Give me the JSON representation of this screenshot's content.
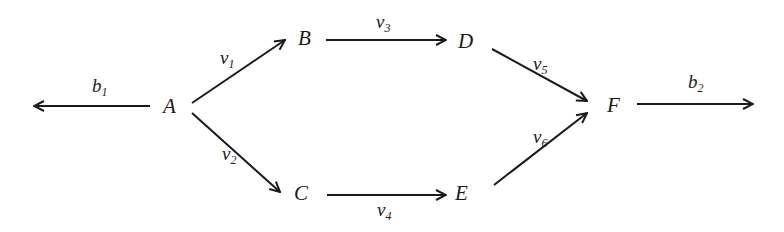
{
  "diagram": {
    "type": "directed-graph",
    "nodes": [
      {
        "id": "A",
        "label": "A"
      },
      {
        "id": "B",
        "label": "B"
      },
      {
        "id": "C",
        "label": "C"
      },
      {
        "id": "D",
        "label": "D"
      },
      {
        "id": "E",
        "label": "E"
      },
      {
        "id": "F",
        "label": "F"
      }
    ],
    "edges": [
      {
        "from": "A",
        "to": "(out-left)",
        "label_base": "b",
        "label_sub": "1"
      },
      {
        "from": "A",
        "to": "B",
        "label_base": "v",
        "label_sub": "1"
      },
      {
        "from": "A",
        "to": "C",
        "label_base": "v",
        "label_sub": "2"
      },
      {
        "from": "B",
        "to": "D",
        "label_base": "v",
        "label_sub": "3"
      },
      {
        "from": "C",
        "to": "E",
        "label_base": "v",
        "label_sub": "4"
      },
      {
        "from": "D",
        "to": "F",
        "label_base": "v",
        "label_sub": "5"
      },
      {
        "from": "E",
        "to": "F",
        "label_base": "v",
        "label_sub": "6"
      },
      {
        "from": "F",
        "to": "(out-right)",
        "label_base": "b",
        "label_sub": "2"
      }
    ],
    "colors": {
      "stroke": "#1a1a1a",
      "background": "#ffffff"
    }
  }
}
